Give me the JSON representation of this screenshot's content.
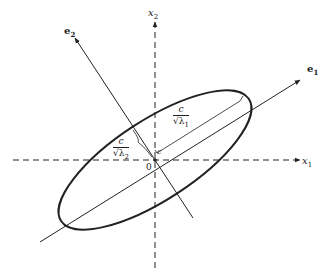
{
  "diagram": {
    "labels": {
      "x1_axis": "x",
      "x1_sub": "1",
      "x2_axis": "x",
      "x2_sub": "2",
      "e1": "e",
      "e1_sub": "1",
      "e2": "e",
      "e2_sub": "2",
      "origin": "0",
      "c_point": "c"
    },
    "half_axis_major": {
      "numerator": "c",
      "denominator": "√λ",
      "sub": "1"
    },
    "half_axis_minor": {
      "numerator": "c",
      "denominator": "√λ",
      "sub": "2"
    },
    "colors": {
      "stroke": "#222222",
      "background": "#ffffff"
    }
  }
}
